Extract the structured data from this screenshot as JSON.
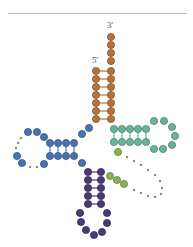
{
  "labels": {
    "three_prime": "3'",
    "five_prime": "5'"
  },
  "colors": {
    "divider": "#b8bcc2",
    "acceptor": "#b5733b",
    "acceptor_stroke": "#7a4a22",
    "d_arm": "#4a72b0",
    "d_arm_stroke": "#2e4f80",
    "t_arm": "#6ab399",
    "t_arm_stroke": "#3f7c66",
    "variable": "#8fae52",
    "variable_stroke": "#5d7a30",
    "anticodon": "#4a3a78",
    "anticodon_stroke": "#2c2150",
    "dots": "#8a8a8a",
    "pair_line_orange": "#b5733b",
    "pair_line_blue": "#4a72b0",
    "pair_line_green": "#6ab399",
    "pair_line_purple": "#4a3a78"
  },
  "arms": {
    "acceptor_stem": {
      "name": "Acceptor stem",
      "left_col_x": 96,
      "right_col_x": 111,
      "right_single_y": [
        37,
        45,
        53,
        61
      ],
      "paired_rows_y": [
        71,
        79,
        87,
        95,
        103,
        111,
        119
      ]
    },
    "d_arm": {
      "name": "D arm",
      "stem_cols_x": [
        50,
        58,
        66,
        74
      ],
      "top_y": 143,
      "bottom_y": 156,
      "loop_beads": [
        [
          44,
          137
        ],
        [
          37,
          132
        ],
        [
          28,
          132
        ],
        [
          17,
          156
        ],
        [
          22,
          163
        ],
        [
          44,
          164
        ]
      ],
      "loop_dots": [
        [
          21,
          138
        ],
        [
          18,
          143
        ],
        [
          16,
          148
        ],
        [
          30,
          167
        ],
        [
          37,
          167
        ]
      ],
      "connectors": [
        [
          82,
          134
        ],
        [
          89,
          128
        ],
        [
          82,
          163
        ]
      ]
    },
    "t_arm": {
      "name": "T arm",
      "stem_cols_x": [
        114,
        122,
        130,
        138,
        146
      ],
      "top_y": 129,
      "bottom_y": 142,
      "loop_beads": [
        [
          154,
          121
        ],
        [
          164,
          121
        ],
        [
          172,
          127
        ],
        [
          175,
          136
        ],
        [
          172,
          145
        ],
        [
          163,
          149
        ],
        [
          154,
          149
        ]
      ]
    },
    "variable_loop": {
      "name": "Variable loop",
      "beads": [
        [
          118,
          152
        ],
        [
          110,
          176
        ],
        [
          117,
          180
        ],
        [
          124,
          184
        ]
      ],
      "dots": [
        [
          127,
          157
        ],
        [
          134,
          161
        ],
        [
          141,
          165
        ],
        [
          148,
          170
        ],
        [
          155,
          175
        ],
        [
          160,
          181
        ],
        [
          162,
          188
        ],
        [
          161,
          194
        ],
        [
          155,
          197
        ],
        [
          148,
          196
        ],
        [
          141,
          193
        ],
        [
          134,
          190
        ]
      ]
    },
    "anticodon_arm": {
      "name": "Anticodon arm",
      "left_col_x": 88,
      "right_col_x": 101,
      "rows_y": [
        172,
        180,
        188,
        196,
        204
      ],
      "loop_beads": [
        [
          80,
          213
        ],
        [
          81,
          222
        ],
        [
          86,
          230
        ],
        [
          94,
          235
        ],
        [
          102,
          232
        ],
        [
          107,
          223
        ],
        [
          107,
          213
        ]
      ]
    }
  }
}
